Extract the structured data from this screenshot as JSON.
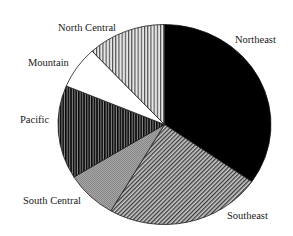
{
  "chart_data": {
    "type": "pie",
    "title": "",
    "start_angle_deg": 0,
    "direction": "clockwise",
    "legend": "none (direct labels)",
    "slices": [
      {
        "label": "Northeast",
        "value": 34.7,
        "pattern": "solid-black"
      },
      {
        "label": "Southeast",
        "value": 23.7,
        "pattern": "fine-diagonal-hatch"
      },
      {
        "label": "South Central",
        "value": 7.8,
        "pattern": "fine-gray"
      },
      {
        "label": "Pacific",
        "value": 15.1,
        "pattern": "dense-vertical-black"
      },
      {
        "label": "Mountain",
        "value": 6.8,
        "pattern": "solid-white"
      },
      {
        "label": "North Central",
        "value": 11.9,
        "pattern": "light-vertical-stripes"
      }
    ],
    "categories": [
      "Northeast",
      "Southeast",
      "South Central",
      "Pacific",
      "Mountain",
      "North Central"
    ],
    "values": [
      34.7,
      23.7,
      7.8,
      15.1,
      6.8,
      11.9
    ]
  },
  "labels": {
    "northeast": "Northeast",
    "southeast": "Southeast",
    "south_central": "South Central",
    "pacific": "Pacific",
    "mountain": "Mountain",
    "north_central": "North Central"
  }
}
